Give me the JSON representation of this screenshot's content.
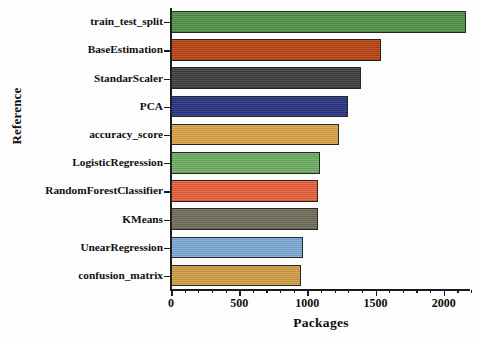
{
  "chart_data": {
    "type": "bar",
    "orientation": "horizontal",
    "title": "",
    "xlabel": "Packages",
    "ylabel": "Reference",
    "categories": [
      "train_test_split",
      "BaseEstimation",
      "StandarScaler",
      "PCA",
      "accuracy_score",
      "LogisticRegression",
      "RandomForestClassifier",
      "KMeans",
      "UnearRegression",
      "confusion_matrix"
    ],
    "values": [
      2160,
      1540,
      1395,
      1300,
      1230,
      1095,
      1075,
      1075,
      970,
      955
    ],
    "colors": [
      "#4f8f46",
      "#b8400f",
      "#3b3b3b",
      "#23307d",
      "#d7a244",
      "#6aab5e",
      "#e85d35",
      "#6d6a57",
      "#7ba7d4",
      "#cf9c42"
    ],
    "xlim": [
      0,
      2200
    ],
    "xticks": [
      0,
      500,
      1000,
      1500,
      2000
    ],
    "xticklabels": [
      "0",
      "500",
      "1000",
      "1500",
      "2000"
    ],
    "minor_tick_step": 100,
    "grid": false,
    "legend": null,
    "bar_edge_color": "#262626",
    "axis_color": "#1b1b1b"
  }
}
